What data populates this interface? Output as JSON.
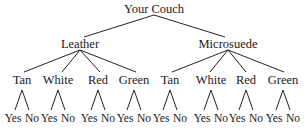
{
  "diagram": {
    "type": "tree",
    "root": "Your Couch",
    "level1": [
      {
        "label": "Leather",
        "children": [
          "Tan",
          "White",
          "Red",
          "Green"
        ]
      },
      {
        "label": "Microsuede",
        "children": [
          "Tan",
          "White",
          "Red",
          "Green"
        ]
      }
    ],
    "leaves": [
      "Yes",
      "No"
    ]
  },
  "labels": {
    "root": "Your Couch",
    "l1_0": "Leather",
    "l1_1": "Microsuede",
    "c0": "Tan",
    "c1": "White",
    "c2": "Red",
    "c3": "Green",
    "c4": "Tan",
    "c5": "White",
    "c6": "Red",
    "c7": "Green",
    "yes": "Yes",
    "no": "No"
  },
  "line_color": "#222222"
}
